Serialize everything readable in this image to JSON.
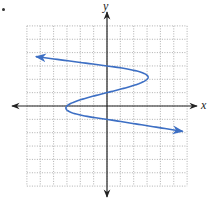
{
  "chart_data": {
    "type": "line",
    "title": "",
    "xlabel": "x",
    "ylabel": "y",
    "xlim": [
      -6,
      6
    ],
    "ylim": [
      -6,
      6
    ],
    "grid": true,
    "grid_style": "dotted",
    "legend": null,
    "equation_estimate": "x = -(y - 3)(y - 1)(y + 1)",
    "series": [
      {
        "name": "curve",
        "color": "#3d6fc4",
        "arrows": "both ends",
        "points": [
          {
            "x": -5.5,
            "y": 3.7
          },
          {
            "x": 0,
            "y": 3
          },
          {
            "x": 3,
            "y": 2
          },
          {
            "x": 0,
            "y": 1
          },
          {
            "x": -3,
            "y": 0
          },
          {
            "x": 0,
            "y": -1
          },
          {
            "x": 5.7,
            "y": -1.9
          }
        ]
      }
    ],
    "key_points": {
      "y_intercepts": [
        3,
        1,
        -1
      ],
      "right_turning_point": {
        "x": 3,
        "y": 2
      },
      "left_turning_point": {
        "x": -3,
        "y": 0
      }
    }
  },
  "labels": {
    "x_axis": "x",
    "y_axis": "y"
  },
  "colors": {
    "curve": "#3d6fc4",
    "axes": "#222222",
    "grid": "#9a9a9a"
  }
}
